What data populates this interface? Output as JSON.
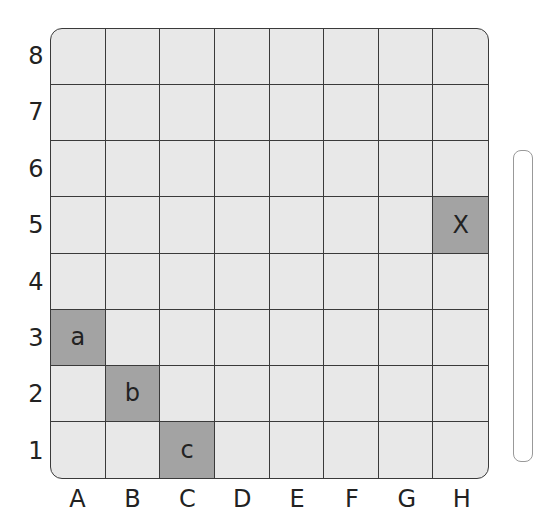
{
  "board": {
    "columns": [
      "A",
      "B",
      "C",
      "D",
      "E",
      "F",
      "G",
      "H"
    ],
    "rows": [
      "8",
      "7",
      "6",
      "5",
      "4",
      "3",
      "2",
      "1"
    ],
    "highlighted_cells": [
      {
        "col": "H",
        "row": "5",
        "label": "X"
      },
      {
        "col": "A",
        "row": "3",
        "label": "a"
      },
      {
        "col": "B",
        "row": "2",
        "label": "b"
      },
      {
        "col": "C",
        "row": "1",
        "label": "c"
      }
    ],
    "colors": {
      "cell": "#e8e8e8",
      "highlight": "#a3a3a3",
      "line": "#3a3a3a"
    }
  }
}
